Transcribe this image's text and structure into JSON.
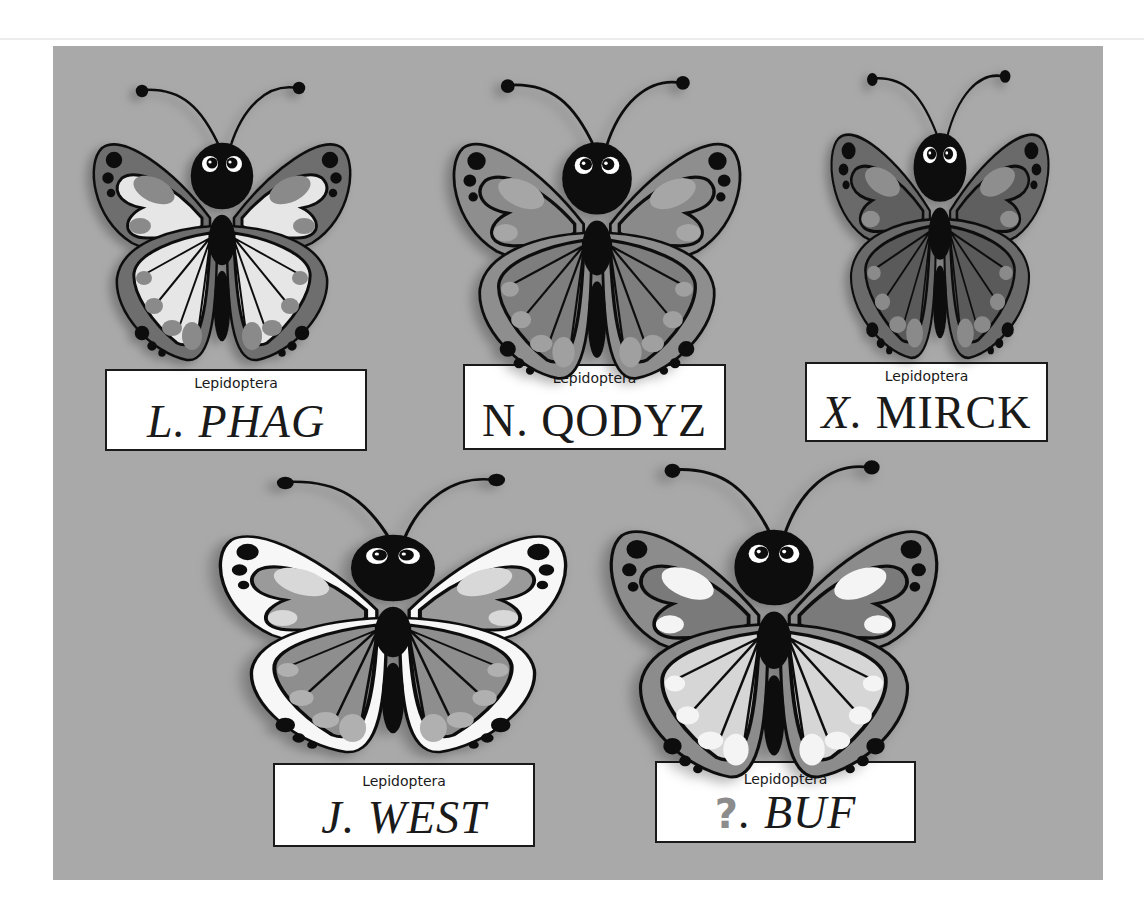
{
  "scene": {
    "background": "#ffffff",
    "panel_color": "#a9a9a9"
  },
  "specimens": [
    {
      "order": "Lepidoptera",
      "genus": "L",
      "species_name": "PHAG",
      "wing_outer": "#6e6e6e",
      "wing_inner": "#e6e6e6",
      "wing_spot": "#8a8a8a",
      "hind_inner": "#e6e6e6",
      "hind_spot": "#8a8a8a"
    },
    {
      "order": "Lepidoptera",
      "genus": "N",
      "species_name": "QODYZ",
      "wing_outer": "#8e8e8e",
      "wing_inner": "#8a8a8a",
      "wing_spot": "#a6a6a6",
      "hind_inner": "#7e7e7e",
      "hind_spot": "#a0a0a0"
    },
    {
      "order": "Lepidoptera",
      "genus": "X",
      "species_name": "MIRCK",
      "wing_outer": "#6a6a6a",
      "wing_inner": "#5e5e5e",
      "wing_spot": "#8e8e8e",
      "hind_inner": "#5a5a5a",
      "hind_spot": "#8a8a8a"
    },
    {
      "order": "Lepidoptera",
      "genus": "J",
      "species_name": "WEST",
      "wing_outer": "#f7f7f7",
      "wing_inner": "#9a9a9a",
      "wing_spot": "#d8d8d8",
      "hind_inner": "#8e8e8e",
      "hind_spot": "#b0b0b0"
    },
    {
      "order": "Lepidoptera",
      "genus": "?",
      "species_name": "BUF",
      "wing_outer": "#8c8c8c",
      "wing_inner": "#7a7a7a",
      "wing_spot": "#f4f4f4",
      "hind_inner": "#d6d6d6",
      "hind_spot": "#f4f4f4"
    }
  ]
}
